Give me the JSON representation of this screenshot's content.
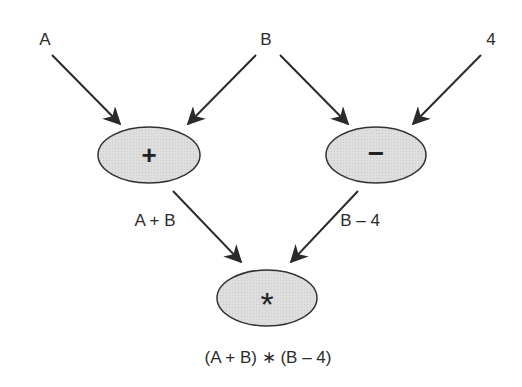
{
  "diagram": {
    "colors": {
      "node_fill": "#dcdcdc",
      "node_stroke": "#333333",
      "edge": "#2a2a2a",
      "text": "#2b2b2b"
    },
    "inputs": [
      {
        "id": "A",
        "label": "A",
        "x": 45,
        "y": 40
      },
      {
        "id": "B",
        "label": "B",
        "x": 266,
        "y": 40
      },
      {
        "id": "four",
        "label": "4",
        "x": 491,
        "y": 40
      }
    ],
    "nodes": [
      {
        "id": "plus",
        "symbol": "+",
        "cx": 149,
        "cy": 155,
        "rx": 51,
        "ry": 28
      },
      {
        "id": "minus",
        "symbol": "−",
        "cx": 376,
        "cy": 155,
        "rx": 50,
        "ry": 28
      },
      {
        "id": "times",
        "symbol": "*",
        "cx": 267,
        "cy": 298,
        "rx": 50,
        "ry": 28
      }
    ],
    "edges": [
      {
        "from": "A",
        "to": "plus"
      },
      {
        "from": "B",
        "to": "plus"
      },
      {
        "from": "B",
        "to": "minus"
      },
      {
        "from": "four",
        "to": "minus"
      },
      {
        "from": "plus",
        "to": "times"
      },
      {
        "from": "minus",
        "to": "times"
      }
    ],
    "edge_labels": [
      {
        "text": "A + B",
        "x": 155,
        "y": 221
      },
      {
        "text": "B – 4",
        "x": 360,
        "y": 221
      }
    ],
    "result_label": {
      "text": "(A + B) ∗ (B – 4)",
      "x": 268,
      "y": 357
    }
  }
}
